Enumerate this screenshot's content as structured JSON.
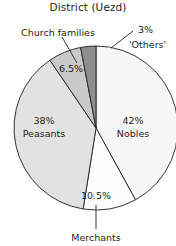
{
  "chart_data": {
    "type": "pie",
    "title": "District (Uezd)",
    "xlabel": "",
    "ylabel": "",
    "legend": "none",
    "grid": false,
    "units": "percent",
    "categories": [
      "Nobles",
      "Merchants",
      "Peasants",
      "Church families",
      "'Others'"
    ],
    "values": [
      42,
      10.5,
      38,
      6.5,
      3
    ],
    "labels": [
      "42%",
      "10.5%",
      "38%",
      "6.5%",
      "3%"
    ],
    "slices": [
      {
        "name": "Nobles",
        "value": 42,
        "label": "42%",
        "name_label": "Nobles",
        "color": "#f7f7f7",
        "callout": false
      },
      {
        "name": "Merchants",
        "value": 10.5,
        "label": "10.5%",
        "name_label": "Merchants",
        "color": "#fdfdfd",
        "callout": true
      },
      {
        "name": "Peasants",
        "value": 38,
        "label": "38%",
        "name_label": "Peasants",
        "color": "#e2e2e2",
        "callout": false
      },
      {
        "name": "Church families",
        "value": 6.5,
        "label": "6.5%",
        "name_label": "Church families",
        "color": "#c9c9c9",
        "callout": true
      },
      {
        "name": "Others",
        "value": 3,
        "label": "3%",
        "name_label": "'Others'",
        "color": "#8e8e8e",
        "callout": true
      }
    ],
    "stroke_color": "#231f20",
    "text_color": "#231f20"
  },
  "chart": {
    "title": "District (Uezd)",
    "label_nobles_pct": "42%",
    "label_nobles_name": "Nobles",
    "label_peasants_pct": "38%",
    "label_peasants_name": "Peasants",
    "label_church_pct": "6.5%",
    "label_church_name": "Church families",
    "label_others_pct": "3%",
    "label_others_name": "'Others'",
    "label_merchants_pct": "10.5%",
    "label_merchants_name": "Merchants"
  }
}
